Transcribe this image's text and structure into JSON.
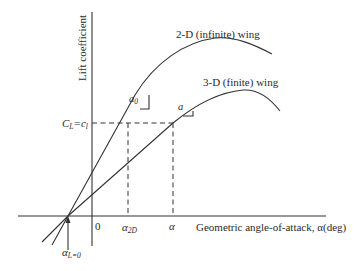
{
  "diagram": {
    "y_axis_label": "Lift coefficient",
    "x_axis_label": "Geometric angle-of-attack, α(deg)",
    "curves": [
      {
        "id": "2d",
        "label": "2-D (infinite) wing",
        "slope_label": "a",
        "slope_subscript": "0"
      },
      {
        "id": "3d",
        "label": "3-D (finite) wing",
        "slope_label": "a",
        "slope_subscript": ""
      }
    ],
    "cl_label_main": "C",
    "cl_label_sub1": "L",
    "cl_label_eq": "=c",
    "cl_label_sub2": "l",
    "x_ticks": {
      "zero": "0",
      "alpha2d": "α",
      "alpha2d_sub": "2D",
      "alpha": "α"
    },
    "zero_lift": {
      "label": "α",
      "sub": "L=0"
    },
    "colors": {
      "line": "#333333",
      "text": "#2a2a2a",
      "background": "#ffffff"
    }
  }
}
